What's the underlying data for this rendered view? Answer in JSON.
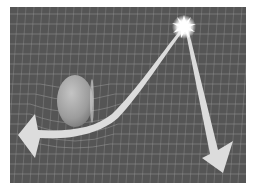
{
  "figure": {
    "elements": {
      "star": {
        "label": "light source",
        "icon": "starburst-icon"
      },
      "mass": {
        "label": "massive object",
        "icon": "sphere-icon"
      },
      "grid": {
        "label": "warped spacetime grid"
      },
      "deflected_ray": {
        "label": "deflected light path",
        "icon": "curved-arrow-icon"
      },
      "straight_ray": {
        "label": "straight light path",
        "icon": "arrow-icon"
      }
    }
  },
  "colors": {
    "background": "#555555",
    "grid": "#9a9a9a",
    "arrow": "#dcdcdc",
    "sphere": "#a8a8a8",
    "star": "#ffffff"
  }
}
